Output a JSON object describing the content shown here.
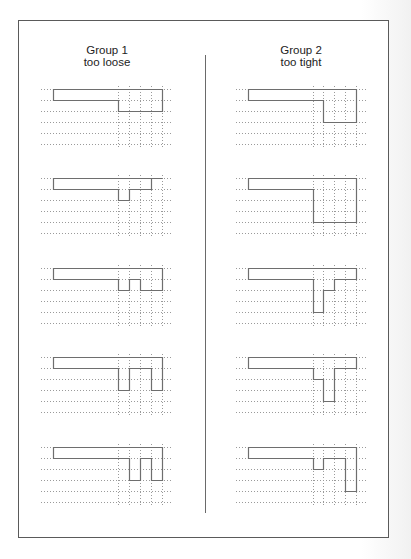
{
  "groups": [
    {
      "title": "Group 1",
      "subtitle": "too loose",
      "panels": [
        {
          "bottoms": [
            2,
            2,
            2,
            2
          ]
        },
        {
          "bottoms": [
            2,
            1,
            1,
            0
          ]
        },
        {
          "bottoms": [
            2,
            1,
            2,
            2
          ]
        },
        {
          "bottoms": [
            3,
            1,
            1,
            3
          ]
        },
        {
          "bottoms": [
            1,
            3,
            1,
            3
          ]
        }
      ]
    },
    {
      "title": "Group 2",
      "subtitle": "too tight",
      "panels": [
        {
          "bottoms": [
            1,
            3,
            3,
            3
          ]
        },
        {
          "bottoms": [
            4,
            4,
            4,
            4
          ]
        },
        {
          "bottoms": [
            4,
            2,
            1,
            1
          ]
        },
        {
          "bottoms": [
            2,
            4,
            1,
            1
          ]
        },
        {
          "bottoms": [
            2,
            1,
            1,
            4
          ]
        }
      ]
    }
  ],
  "grid": {
    "rows": 6,
    "columns": 4
  },
  "colors": {
    "outline": "#6e6e6e",
    "dots": "#9a9a9a",
    "frame": "#5a5a5a",
    "divider": "#6a6a6a"
  }
}
